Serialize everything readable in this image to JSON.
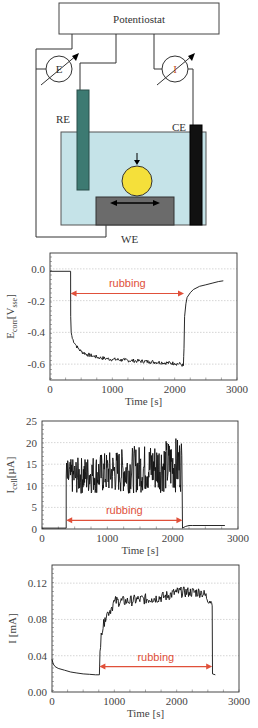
{
  "diagram": {
    "potentiostat_label": "Potentiostat",
    "e_meter_label": "E",
    "i_meter_label": "I",
    "re_label": "RE",
    "ce_label": "CE",
    "we_label": "WE",
    "colors": {
      "electrolyte": "#c5e3e8",
      "reference_electrode": "#3d7a72",
      "counter_electrode": "#111111",
      "ball": "#f5e03a",
      "working_electrode": "#6b6b6b",
      "i_label": "#c0502a"
    }
  },
  "chart_data": [
    {
      "type": "line",
      "title": "",
      "xlabel": "Time [s]",
      "ylabel": "E_corr [V_sse]",
      "xlim": [
        0,
        3000
      ],
      "ylim": [
        -0.7,
        0.1
      ],
      "xticks": [
        "0",
        "1000",
        "2000",
        "3000"
      ],
      "yticks": [
        "0.0",
        "-0.2",
        "-0.4",
        "-0.6"
      ],
      "grid": true,
      "annotation": {
        "text": "rubbing",
        "x_start": 330,
        "x_end": 2150,
        "y": -0.155,
        "color": "#e0503a"
      },
      "series": [
        {
          "name": "E_corr",
          "x": [
            0,
            330,
            332,
            340,
            360,
            400,
            450,
            500,
            600,
            700,
            800,
            900,
            1000,
            1200,
            1400,
            1600,
            1800,
            2000,
            2100,
            2140,
            2150,
            2160,
            2180,
            2200,
            2250,
            2300,
            2400,
            2500,
            2600,
            2700,
            2780
          ],
          "y": [
            -0.015,
            -0.015,
            -0.3,
            -0.4,
            -0.44,
            -0.47,
            -0.5,
            -0.52,
            -0.54,
            -0.55,
            -0.56,
            -0.565,
            -0.57,
            -0.575,
            -0.58,
            -0.585,
            -0.59,
            -0.595,
            -0.6,
            -0.61,
            -0.5,
            -0.3,
            -0.22,
            -0.18,
            -0.15,
            -0.13,
            -0.11,
            -0.1,
            -0.09,
            -0.08,
            -0.075
          ]
        }
      ]
    },
    {
      "type": "line",
      "title": "",
      "xlabel": "Time [s]",
      "ylabel": "I_cell [µA]",
      "xlim": [
        0,
        3000
      ],
      "ylim": [
        0,
        25
      ],
      "xticks": [
        "0",
        "1000",
        "2000",
        "3000"
      ],
      "yticks": [
        "0",
        "5",
        "10",
        "15",
        "20",
        "25"
      ],
      "grid": true,
      "annotation": {
        "text": "rubbing",
        "x_start": 370,
        "x_end": 2150,
        "y": 2.0,
        "color": "#e0503a"
      },
      "series": [
        {
          "name": "I_cell",
          "x": [
            0,
            370,
            2150,
            2160,
            2200,
            2250,
            2300,
            2800
          ],
          "y": [
            0.2,
            0.2,
            0.2,
            0.3,
            0.6,
            0.8,
            0.8,
            0.8
          ],
          "noisy_segment": {
            "x_start": 370,
            "x_end": 2150,
            "mean_start": 12,
            "mean_end": 15,
            "min": 5,
            "max": 23.5
          }
        }
      ]
    },
    {
      "type": "line",
      "title": "",
      "xlabel": "Time [s]",
      "ylabel": "I [mA]",
      "xlim": [
        0,
        3000
      ],
      "ylim": [
        0,
        0.14
      ],
      "xticks": [
        "0",
        "1000",
        "2000",
        "3000"
      ],
      "yticks": [
        "0.00",
        "0.04",
        "0.08",
        "0.12"
      ],
      "grid": true,
      "annotation": {
        "text": "rubbing",
        "x_start": 760,
        "x_end": 2570,
        "y": 0.028,
        "color": "#e0503a"
      },
      "series": [
        {
          "name": "I",
          "x": [
            0,
            20,
            50,
            100,
            200,
            300,
            400,
            500,
            600,
            700,
            760,
            770,
            790,
            820,
            850,
            900,
            950,
            1000,
            1200,
            1400,
            1600,
            1800,
            2000,
            2200,
            2400,
            2550,
            2570,
            2575,
            2620
          ],
          "y": [
            0.036,
            0.031,
            0.028,
            0.026,
            0.024,
            0.022,
            0.021,
            0.02,
            0.0195,
            0.019,
            0.019,
            0.045,
            0.065,
            0.07,
            0.082,
            0.088,
            0.092,
            0.1,
            0.1,
            0.102,
            0.103,
            0.105,
            0.11,
            0.11,
            0.11,
            0.1,
            0.095,
            0.02,
            0.019
          ]
        }
      ]
    }
  ]
}
